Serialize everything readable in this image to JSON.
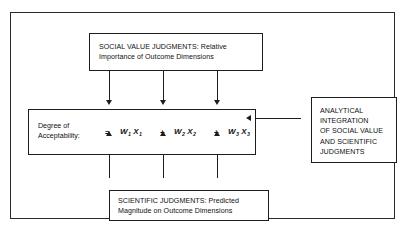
{
  "diagram": {
    "boxes": {
      "social_value": {
        "label": "SOCIAL  VALUE  JUDGMENTS:  Relative\nImportance of Outcome Dimensions"
      },
      "equation": {
        "row_label": "Degree of\nAcceptability:",
        "equals": "=",
        "terms": [
          {
            "weight": "W",
            "weight_sub": "1",
            "variable": "X",
            "variable_sub": "1"
          },
          {
            "weight": "W",
            "weight_sub": "2",
            "variable": "X",
            "variable_sub": "2"
          },
          {
            "weight": "W",
            "weight_sub": "3",
            "variable": "X",
            "variable_sub": "3"
          }
        ],
        "operators": [
          "+",
          "+"
        ]
      },
      "scientific": {
        "label": "SCIENTIFIC  JUDGMENTS:  Predicted\nMagnitude on Outcome Dimensions"
      },
      "analytical": {
        "label": "ANALYTICAL\nINTEGRATION\nOF  SOCIAL  VALUE\nAND  SCIENTIFIC\nJUDGMENTS"
      }
    },
    "colors": {
      "line": "#1d1d1d",
      "frame": "#2b2b2b",
      "background": "#ffffff",
      "text": "#111111"
    }
  }
}
